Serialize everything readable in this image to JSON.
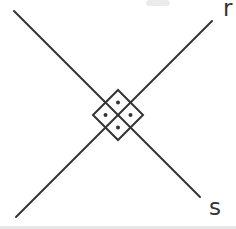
{
  "window": {
    "width": 236,
    "height": 229,
    "background": "#ffffff"
  },
  "figure": {
    "kind": "geometry-diagram",
    "ink_color": "#333333",
    "stroke_width": 2,
    "lines": [
      {
        "id": "s",
        "x1": 14,
        "y1": 11,
        "x2": 200,
        "y2": 197
      },
      {
        "id": "r",
        "x1": 16,
        "y1": 217,
        "x2": 212,
        "y2": 21
      }
    ],
    "labels": [
      {
        "id": "r",
        "text": "r",
        "x": 223,
        "y": 16
      },
      {
        "id": "s",
        "text": "s",
        "x": 209,
        "y": 215
      }
    ],
    "diamond": {
      "cx": 118,
      "cy": 115,
      "half_diagonal": 25,
      "points": "118,90 143,115 118,140 93,115"
    },
    "dots": {
      "radius": 2,
      "color": "#333333",
      "points": [
        {
          "cx": 118,
          "cy": 102.5
        },
        {
          "cx": 130.5,
          "cy": 115
        },
        {
          "cx": 118,
          "cy": 127.5
        },
        {
          "cx": 105.5,
          "cy": 115
        }
      ]
    },
    "artifacts": {
      "top_smudge": {
        "x": 146,
        "y": 0,
        "width": 24,
        "height": 6,
        "color": "#e6e6e6",
        "opacity": 0.8
      },
      "bottom_band": {
        "x": 0,
        "y": 226,
        "width": 236,
        "height": 3,
        "color": "#dcdcdc",
        "opacity": 0.7
      }
    }
  }
}
